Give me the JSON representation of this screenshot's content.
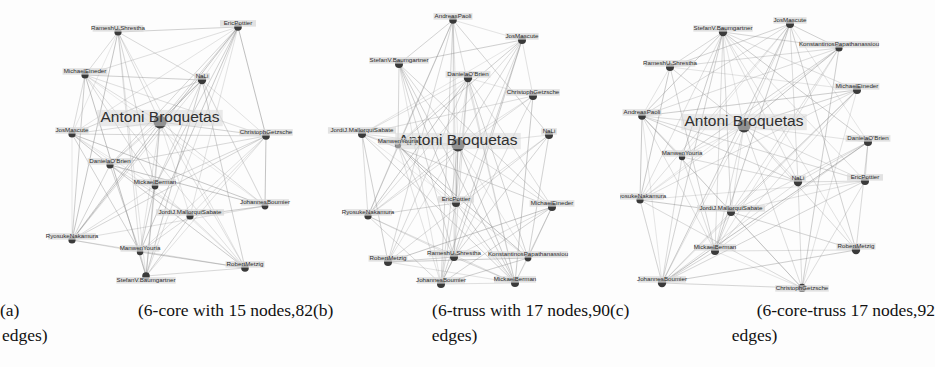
{
  "figure": {
    "type": "three-panel-graph-figure",
    "background": "#fdfdfd",
    "edge_color": "#8a8a8a",
    "node_color": "#3a3a3a",
    "label_color": "#2b2b2b",
    "label_halo": "#d8d8d8"
  },
  "captions": [
    {
      "tag": "(a)",
      "line1": "(6-core   with   15   nodes,82",
      "line2": "edges)",
      "full": "(a) (6-core with 15 nodes,82 edges)",
      "structure": "6-core",
      "nodes": 15,
      "edges": 82
    },
    {
      "tag": "(b)",
      "line1": "(6-truss   with   17   nodes,90",
      "line2": "edges)",
      "full": "(b) (6-truss with 17 nodes,90 edges)",
      "structure": "6-truss",
      "nodes": 17,
      "edges": 90
    },
    {
      "tag": "(c)",
      "line1": "(6-core-truss   17   nodes,92",
      "line2": "edges)",
      "full": "(c) (6-core-truss 17 nodes,92 edges)",
      "structure": "6-core-truss",
      "nodes": 17,
      "edges": 92
    }
  ],
  "chart_data": {
    "type": "network-graph",
    "title": "",
    "panels": [
      {
        "id": "a",
        "label": "(a) 6-core with 15 nodes, 82 edges",
        "node_count": 15,
        "edge_count": 82,
        "width": 310,
        "height": 292,
        "hub": "Antoni Broquetas",
        "nodes": [
          {
            "id": 0,
            "label": "Antoni Broquetas",
            "x": 160,
            "y": 122,
            "r": 6.5,
            "big": true,
            "anchor": "middle",
            "lx": 160,
            "ly": 122
          },
          {
            "id": 1,
            "label": "RameshU.Shrestha",
            "x": 118,
            "y": 32,
            "r": 3.6,
            "anchor": "middle",
            "lx": 118,
            "ly": 30
          },
          {
            "id": 2,
            "label": "EricPottier",
            "x": 238,
            "y": 27,
            "r": 3.8,
            "anchor": "middle",
            "lx": 238,
            "ly": 25
          },
          {
            "id": 3,
            "label": "MichaelEineder",
            "x": 85,
            "y": 75,
            "r": 3.6,
            "anchor": "middle",
            "lx": 85,
            "ly": 73
          },
          {
            "id": 4,
            "label": "NaLi",
            "x": 202,
            "y": 80,
            "r": 4.2,
            "anchor": "middle",
            "lx": 202,
            "ly": 78
          },
          {
            "id": 5,
            "label": "JosMascute",
            "x": 72,
            "y": 134,
            "r": 3.6,
            "anchor": "middle",
            "lx": 72,
            "ly": 132
          },
          {
            "id": 6,
            "label": "ChristophGetzsche",
            "x": 266,
            "y": 136,
            "r": 3.8,
            "anchor": "middle",
            "lx": 266,
            "ly": 134
          },
          {
            "id": 7,
            "label": "DanielaO'Brien",
            "x": 110,
            "y": 165,
            "r": 3.6,
            "anchor": "middle",
            "lx": 110,
            "ly": 163
          },
          {
            "id": 8,
            "label": "MickaelBerman",
            "x": 155,
            "y": 186,
            "r": 3.4,
            "anchor": "middle",
            "lx": 155,
            "ly": 184
          },
          {
            "id": 9,
            "label": "JohannesBoumier",
            "x": 265,
            "y": 206,
            "r": 3.4,
            "anchor": "middle",
            "lx": 265,
            "ly": 204
          },
          {
            "id": 10,
            "label": "JordiJ.MallorquiSabate",
            "x": 190,
            "y": 216,
            "r": 3.6,
            "anchor": "middle",
            "lx": 190,
            "ly": 214
          },
          {
            "id": 11,
            "label": "RyosukeNakamura",
            "x": 72,
            "y": 240,
            "r": 3.6,
            "anchor": "middle",
            "lx": 72,
            "ly": 238
          },
          {
            "id": 12,
            "label": "ManwenYouria",
            "x": 140,
            "y": 252,
            "r": 3.2,
            "anchor": "middle",
            "lx": 140,
            "ly": 250
          },
          {
            "id": 13,
            "label": "StefanV.Baumgartner",
            "x": 146,
            "y": 276,
            "r": 3.8,
            "anchor": "middle",
            "lx": 146,
            "ly": 282
          },
          {
            "id": 14,
            "label": "RobertMetzig",
            "x": 245,
            "y": 268,
            "r": 3.8,
            "anchor": "middle",
            "lx": 245,
            "ly": 266
          }
        ]
      },
      {
        "id": "b",
        "label": "(b) 6-truss with 17 nodes, 90 edges",
        "node_count": 17,
        "edge_count": 90,
        "width": 310,
        "height": 292,
        "hub": "Antoni Broquetas",
        "nodes": [
          {
            "id": 0,
            "label": "Antoni Broquetas",
            "x": 148,
            "y": 145,
            "r": 6.5,
            "big": true,
            "anchor": "middle",
            "lx": 148,
            "ly": 145
          },
          {
            "id": 1,
            "label": "AndreasPaoli",
            "x": 143,
            "y": 20,
            "r": 3.8,
            "anchor": "middle",
            "lx": 143,
            "ly": 18
          },
          {
            "id": 2,
            "label": "JosMascute",
            "x": 212,
            "y": 40,
            "r": 4.0,
            "anchor": "middle",
            "lx": 212,
            "ly": 38
          },
          {
            "id": 3,
            "label": "StefanV.Baumgartner",
            "x": 89,
            "y": 64,
            "r": 4.0,
            "anchor": "middle",
            "lx": 89,
            "ly": 62
          },
          {
            "id": 4,
            "label": "DanielaO'Brien",
            "x": 158,
            "y": 78,
            "r": 4.2,
            "anchor": "middle",
            "lx": 158,
            "ly": 76
          },
          {
            "id": 5,
            "label": "ChristophGetzsche",
            "x": 223,
            "y": 96,
            "r": 4.0,
            "anchor": "middle",
            "lx": 223,
            "ly": 94
          },
          {
            "id": 6,
            "label": "JordiJ.MallorquiSabate",
            "x": 52,
            "y": 134,
            "r": 4.0,
            "anchor": "middle",
            "lx": 52,
            "ly": 132
          },
          {
            "id": 7,
            "label": "ManwenYouria",
            "x": 88,
            "y": 145,
            "r": 3.2,
            "anchor": "middle",
            "lx": 88,
            "ly": 143
          },
          {
            "id": 8,
            "label": "NaLi",
            "x": 239,
            "y": 135,
            "r": 4.0,
            "anchor": "middle",
            "lx": 239,
            "ly": 133
          },
          {
            "id": 9,
            "label": "EricPottier",
            "x": 146,
            "y": 203,
            "r": 4.0,
            "anchor": "middle",
            "lx": 146,
            "ly": 201
          },
          {
            "id": 10,
            "label": "MichaelEineder",
            "x": 242,
            "y": 207,
            "r": 4.0,
            "anchor": "middle",
            "lx": 242,
            "ly": 205
          },
          {
            "id": 11,
            "label": "RyosukeNakamura",
            "x": 58,
            "y": 216,
            "r": 3.6,
            "anchor": "middle",
            "lx": 58,
            "ly": 214
          },
          {
            "id": 12,
            "label": "RameshU.Shrestha",
            "x": 144,
            "y": 257,
            "r": 4.0,
            "anchor": "middle",
            "lx": 144,
            "ly": 255
          },
          {
            "id": 13,
            "label": "KonstantinosPapathanassiou",
            "x": 218,
            "y": 258,
            "r": 3.4,
            "anchor": "middle",
            "lx": 218,
            "ly": 256
          },
          {
            "id": 14,
            "label": "RobertMetzig",
            "x": 78,
            "y": 262,
            "r": 4.0,
            "anchor": "middle",
            "lx": 78,
            "ly": 260
          },
          {
            "id": 15,
            "label": "JohannesBoumier",
            "x": 131,
            "y": 284,
            "r": 4.0,
            "anchor": "middle",
            "lx": 131,
            "ly": 282
          },
          {
            "id": 16,
            "label": "MickaelBerman",
            "x": 205,
            "y": 283,
            "r": 4.0,
            "anchor": "middle",
            "lx": 205,
            "ly": 281
          }
        ]
      },
      {
        "id": "c",
        "label": "(c) 6-core-truss 17 nodes, 92 edges",
        "node_count": 17,
        "edge_count": 92,
        "width": 315,
        "height": 292,
        "hub": "Antoni Broquetas",
        "nodes": [
          {
            "id": 0,
            "label": "Antoni Broquetas",
            "x": 124,
            "y": 126,
            "r": 6.5,
            "big": true,
            "anchor": "middle",
            "lx": 124,
            "ly": 126
          },
          {
            "id": 1,
            "label": "StefanV.Baumgartner",
            "x": 103,
            "y": 32,
            "r": 4.2,
            "anchor": "middle",
            "lx": 103,
            "ly": 30
          },
          {
            "id": 2,
            "label": "JosMascute",
            "x": 170,
            "y": 24,
            "r": 4.0,
            "anchor": "middle",
            "lx": 170,
            "ly": 22
          },
          {
            "id": 3,
            "label": "KonstantinosPapathanassiou",
            "x": 219,
            "y": 48,
            "r": 3.6,
            "anchor": "middle",
            "lx": 219,
            "ly": 46
          },
          {
            "id": 4,
            "label": "RameshU.Shrestha",
            "x": 50,
            "y": 67,
            "r": 4.0,
            "anchor": "middle",
            "lx": 50,
            "ly": 65
          },
          {
            "id": 5,
            "label": "MichaelEineder",
            "x": 237,
            "y": 90,
            "r": 4.0,
            "anchor": "middle",
            "lx": 237,
            "ly": 88
          },
          {
            "id": 6,
            "label": "AndreasPaoli",
            "x": 22,
            "y": 116,
            "r": 3.8,
            "anchor": "middle",
            "lx": 22,
            "ly": 114
          },
          {
            "id": 7,
            "label": "DanielaO'Brien",
            "x": 248,
            "y": 142,
            "r": 4.0,
            "anchor": "middle",
            "lx": 248,
            "ly": 140
          },
          {
            "id": 8,
            "label": "ManwenYouria",
            "x": 62,
            "y": 157,
            "r": 3.2,
            "anchor": "middle",
            "lx": 62,
            "ly": 155
          },
          {
            "id": 9,
            "label": "NaLi",
            "x": 178,
            "y": 182,
            "r": 4.2,
            "anchor": "middle",
            "lx": 178,
            "ly": 180
          },
          {
            "id": 10,
            "label": "EricPottier",
            "x": 245,
            "y": 181,
            "r": 4.0,
            "anchor": "middle",
            "lx": 245,
            "ly": 179
          },
          {
            "id": 11,
            "label": "RyosukeNakamura",
            "x": 20,
            "y": 200,
            "r": 3.6,
            "anchor": "middle",
            "lx": 20,
            "ly": 198
          },
          {
            "id": 12,
            "label": "JordiJ.MallorquiSabate",
            "x": 111,
            "y": 212,
            "r": 4.0,
            "anchor": "middle",
            "lx": 111,
            "ly": 210
          },
          {
            "id": 13,
            "label": "RobertMetzig",
            "x": 236,
            "y": 250,
            "r": 4.2,
            "anchor": "middle",
            "lx": 236,
            "ly": 248
          },
          {
            "id": 14,
            "label": "MickaelBerman",
            "x": 95,
            "y": 251,
            "r": 4.0,
            "anchor": "middle",
            "lx": 95,
            "ly": 249
          },
          {
            "id": 15,
            "label": "JohannesBoumier",
            "x": 42,
            "y": 283,
            "r": 4.2,
            "anchor": "middle",
            "lx": 42,
            "ly": 281
          },
          {
            "id": 16,
            "label": "ChristophGetzsche",
            "x": 182,
            "y": 288,
            "r": 4.2,
            "anchor": "middle",
            "lx": 182,
            "ly": 290
          }
        ]
      }
    ]
  }
}
